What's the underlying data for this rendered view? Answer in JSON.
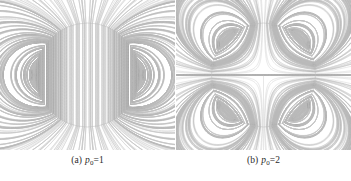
{
  "figure": {
    "type": "field-line-streamplot-pair",
    "background_color": "#ffffff",
    "line_color": "#b9b9b9",
    "caption_color": "#2b2b2b"
  },
  "panels": [
    {
      "id": "a",
      "tag": "(a)",
      "symbol": "p",
      "subscript": "0",
      "equals": "=1",
      "caption_text": "(a) p0=1",
      "multipole_order": 1,
      "center": {
        "x": 85,
        "y": 76
      },
      "radius": 52,
      "n_lines": 44,
      "description": "dipole-like field pattern, near-vertical interior lines"
    },
    {
      "id": "b",
      "tag": "(b)",
      "symbol": "p",
      "subscript": "0",
      "equals": "=2",
      "caption_text": "(b) p0=2",
      "multipole_order": 2,
      "center": {
        "x": 86,
        "y": 76
      },
      "radius": 52,
      "n_lines": 44,
      "description": "quadrupole-like field pattern with X-shaped separatrix at center"
    }
  ],
  "chart_data": {
    "type": "line",
    "title": "",
    "xlabel": "",
    "ylabel": "",
    "series": [
      {
        "name": "panel-a-field-lines",
        "p0": 1,
        "count": 44
      },
      {
        "name": "panel-b-field-lines",
        "p0": 2,
        "count": 44
      }
    ]
  }
}
